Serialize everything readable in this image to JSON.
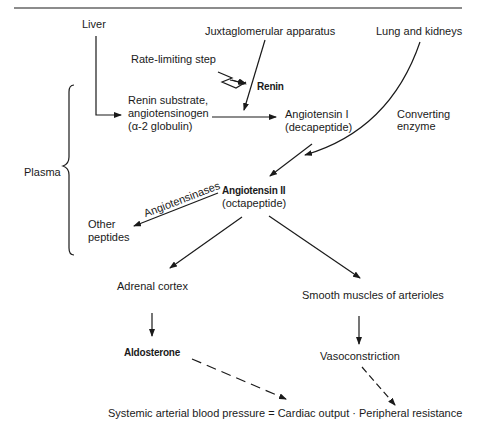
{
  "diagram": {
    "title_rule": true,
    "nodes": {
      "liver": "Liver",
      "jga": "Juxtaglomerular apparatus",
      "lung_kidneys": "Lung and kidneys",
      "rate_limiting": "Rate-limiting step",
      "renin": "Renin",
      "substrate_l1": "Renin substrate,",
      "substrate_l2": "angiotensinogen",
      "substrate_l3": "(α-2 globulin)",
      "ang1_l1": "Angiotensin I",
      "ang1_l2": "(decapeptide)",
      "converting_l1": "Converting",
      "converting_l2": "enzyme",
      "plasma": "Plasma",
      "ang2_l1": "Angiotensin II",
      "ang2_l2": "(octapeptide)",
      "angiotensinases": "Angiotensinases",
      "other_l1": "Other",
      "other_l2": "peptides",
      "adrenal": "Adrenal cortex",
      "smooth": "Smooth muscles of arterioles",
      "aldosterone": "Aldosterone",
      "vasoconstriction": "Vasoconstriction",
      "equation": "Systemic arterial blood pressure = Cardiac output · Peripheral resistance"
    },
    "colors": {
      "ink": "#1a1a1a",
      "background": "#ffffff"
    }
  }
}
